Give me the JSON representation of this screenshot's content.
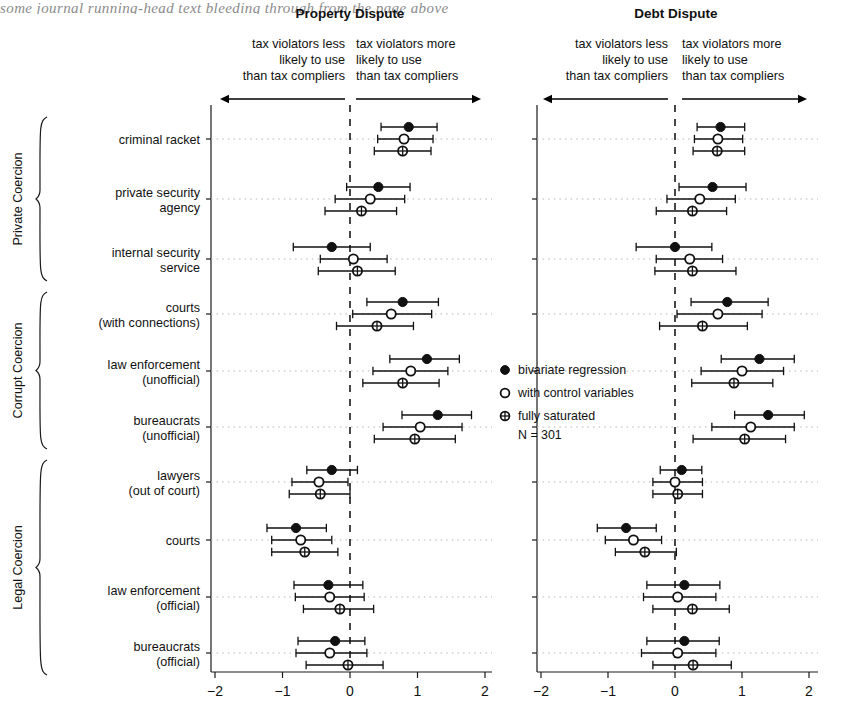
{
  "bleed_text": "some journal running-head text bleeding through from the page above",
  "panels": [
    {
      "key": "property",
      "title": "Property Dispute",
      "left_label": "tax violators less\nlikely to use\nthan tax compliers",
      "right_label": "tax violators more\nlikely to use\nthan tax compliers"
    },
    {
      "key": "debt",
      "title": "Debt Dispute",
      "left_label": "tax violators less\nlikely to use\nthan tax compliers",
      "right_label": "tax violators more\nlikely to use\nthan tax compliers"
    }
  ],
  "groups": [
    {
      "label": "Private Coercion",
      "rows": [
        0,
        1,
        2
      ]
    },
    {
      "label": "Corrupt Coercion",
      "rows": [
        3,
        4,
        5
      ]
    },
    {
      "label": "Legal Coercion",
      "rows": [
        6,
        7,
        8,
        9
      ]
    }
  ],
  "legend": {
    "items": [
      {
        "glyph": "filled-circle",
        "label": "bivariate regression"
      },
      {
        "glyph": "open-circle",
        "label": "with control variables"
      },
      {
        "glyph": "crossed-circle",
        "label": "fully saturated"
      }
    ],
    "n_label": "N = 301"
  },
  "chart_data": {
    "type": "scatter",
    "title": "",
    "subtitle": "",
    "xlabel": "",
    "ylabel": "",
    "xlim": [
      -2.4,
      2.4
    ],
    "xticks": [
      -2,
      -1,
      0,
      1,
      2
    ],
    "xticklabels": [
      "−2",
      "−1",
      "0",
      "1",
      "2"
    ],
    "grid": "horizontal dotted at each category",
    "reference_line": {
      "x": 0,
      "style": "dashed"
    },
    "legend_position": "center-right inside plot",
    "categories": [
      "criminal racket",
      "private security\nagency",
      "internal security\nservice",
      "courts\n(with connections)",
      "law enforcement\n(unofficial)",
      "bureaucrats\n(unofficial)",
      "lawyers\n(out of court)",
      "courts",
      "law enforcement\n(official)",
      "bureaucrats\n(official)"
    ],
    "series": [
      {
        "name": "bivariate regression",
        "glyph": "filled-circle"
      },
      {
        "name": "with control variables",
        "glyph": "open-circle"
      },
      {
        "name": "fully saturated",
        "glyph": "crossed-circle"
      }
    ],
    "panels": {
      "property": {
        "title": "Property Dispute",
        "estimates": {
          "bivariate regression": [
            0.87,
            0.42,
            -0.27,
            0.78,
            1.14,
            1.3,
            -0.27,
            -0.8,
            -0.32,
            -0.22
          ],
          "with control variables": [
            0.8,
            0.3,
            0.05,
            0.61,
            0.9,
            1.04,
            -0.46,
            -0.73,
            -0.3,
            -0.3
          ],
          "fully saturated": [
            0.78,
            0.17,
            0.11,
            0.4,
            0.78,
            0.96,
            -0.44,
            -0.67,
            -0.15,
            -0.03
          ]
        },
        "ci_low": {
          "bivariate regression": [
            0.46,
            -0.05,
            -0.84,
            0.25,
            0.59,
            0.77,
            -0.64,
            -1.23,
            -0.83,
            -0.77
          ],
          "with control variables": [
            0.41,
            -0.22,
            -0.44,
            0.04,
            0.34,
            0.49,
            -0.86,
            -1.16,
            -0.81,
            -0.8
          ],
          "fully saturated": [
            0.36,
            -0.37,
            -0.47,
            -0.2,
            0.19,
            0.36,
            -0.9,
            -1.16,
            -0.69,
            -0.65
          ]
        },
        "ci_high": {
          "bivariate regression": [
            1.29,
            0.89,
            0.3,
            1.31,
            1.62,
            1.8,
            0.11,
            -0.35,
            0.19,
            0.22
          ],
          "with control variables": [
            1.23,
            0.81,
            0.55,
            1.21,
            1.45,
            1.66,
            -0.03,
            -0.27,
            0.21,
            0.25
          ],
          "fully saturated": [
            1.2,
            0.69,
            0.67,
            0.94,
            1.32,
            1.56,
            0.0,
            -0.18,
            0.35,
            0.49
          ]
        }
      },
      "debt": {
        "title": "Debt Dispute",
        "estimates": {
          "bivariate regression": [
            0.68,
            0.56,
            0.0,
            0.78,
            1.26,
            1.39,
            0.1,
            -0.73,
            0.14,
            0.14
          ],
          "with control variables": [
            0.64,
            0.37,
            0.22,
            0.64,
            1.0,
            1.13,
            0.0,
            -0.62,
            0.04,
            0.04
          ],
          "fully saturated": [
            0.63,
            0.26,
            0.26,
            0.41,
            0.88,
            1.04,
            0.04,
            -0.45,
            0.26,
            0.27
          ]
        },
        "ci_low": {
          "bivariate regression": [
            0.33,
            0.06,
            -0.58,
            0.24,
            0.69,
            0.89,
            -0.22,
            -1.16,
            -0.42,
            -0.42
          ],
          "with control variables": [
            0.29,
            -0.12,
            -0.28,
            0.03,
            0.39,
            0.55,
            -0.33,
            -1.04,
            -0.47,
            -0.5
          ],
          "fully saturated": [
            0.27,
            -0.28,
            -0.3,
            -0.23,
            0.25,
            0.27,
            -0.33,
            -0.89,
            -0.33,
            -0.33
          ]
        },
        "ci_high": {
          "bivariate regression": [
            1.04,
            1.06,
            0.55,
            1.39,
            1.78,
            1.93,
            0.4,
            -0.28,
            0.67,
            0.66
          ],
          "with control variables": [
            1.01,
            0.9,
            0.71,
            1.3,
            1.62,
            1.78,
            0.41,
            -0.2,
            0.61,
            0.61
          ],
          "fully saturated": [
            1.04,
            0.77,
            0.91,
            1.08,
            1.46,
            1.65,
            0.41,
            0.02,
            0.81,
            0.84
          ]
        }
      }
    }
  }
}
